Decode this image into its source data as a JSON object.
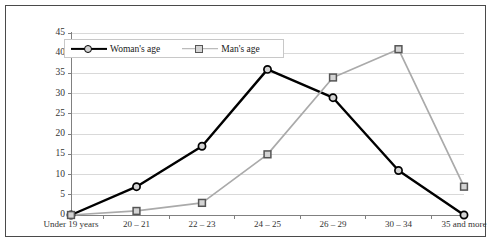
{
  "chart_data": {
    "type": "line",
    "title": "",
    "xlabel": "",
    "ylabel": "",
    "ylim": [
      0,
      45
    ],
    "yticks": [
      0,
      5,
      10,
      15,
      20,
      25,
      30,
      35,
      40,
      45
    ],
    "grid": true,
    "legend_position": "top-left",
    "categories": [
      "Under 19 years",
      "20 – 21",
      "22 – 23",
      "24 – 25",
      "26 – 29",
      "30 – 34",
      "35 and more"
    ],
    "series": [
      {
        "name": "Woman's age",
        "color": "#000000",
        "marker": "circle",
        "values": [
          0,
          7,
          17,
          36,
          29,
          11,
          0
        ]
      },
      {
        "name": "Man's age",
        "color": "#aaaaaa",
        "marker": "square",
        "values": [
          0,
          1,
          3,
          15,
          34,
          41,
          7
        ]
      }
    ]
  },
  "legend": {
    "items": [
      {
        "label": "Woman's age"
      },
      {
        "label": "Man's age"
      }
    ]
  },
  "colors": {
    "woman_line": "#000000",
    "man_line": "#aaaaaa",
    "marker_fill": "#d4d4d4",
    "gridline": "#d9d9d9",
    "axis": "#808080",
    "frame": "#4a4a4a",
    "background": "#ffffff"
  }
}
